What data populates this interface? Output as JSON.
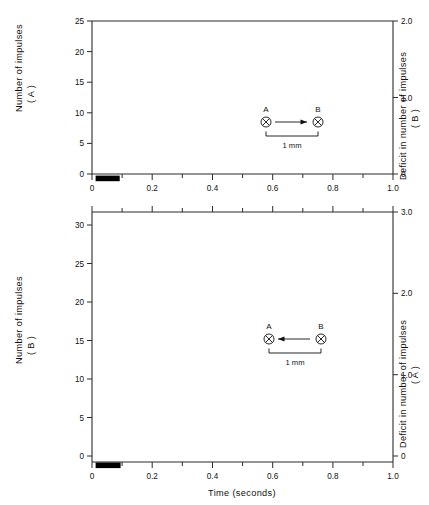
{
  "figure": {
    "background": "#ffffff",
    "ink": "#111111"
  },
  "chart_data": [
    {
      "id": "top-panel",
      "type": "line",
      "title": "",
      "xlabel": "",
      "ylabel": "Number of impulses (A)",
      "y2label": "Deficit in number of impulses (B)",
      "xlim": [
        0,
        1.0
      ],
      "ylim": [
        0,
        25
      ],
      "y2lim": [
        0,
        2.0
      ],
      "xticks": [
        0,
        0.2,
        0.4,
        0.6,
        0.8,
        1.0
      ],
      "xticklabels": [
        "0",
        "0.2",
        "0.4",
        "0.6",
        "0.8",
        "1.0"
      ],
      "xminorticks": [
        0.1,
        0.3,
        0.5,
        0.7,
        0.9
      ],
      "yticks": [
        0,
        5,
        10,
        15,
        20,
        25
      ],
      "yticklabels": [
        "0",
        "5",
        "10",
        "15",
        "20",
        "25"
      ],
      "y2ticks": [
        0,
        1.0,
        2.0
      ],
      "y2ticklabels": [
        "0",
        "1.0",
        "2.0"
      ],
      "grid": false,
      "legend_position": "inline-curve-labels",
      "stimulus_bar": {
        "x_start": 0.012,
        "x_end": 0.092,
        "label": ""
      },
      "inset": {
        "left_label": "A",
        "right_label": "B",
        "arrow_direction": "right",
        "scale_label": "1 mm"
      },
      "series": [
        {
          "name": "A",
          "label": "A",
          "label_x": 0.135,
          "label_y": 11.9,
          "x": [
            0.062,
            0.072,
            0.082,
            0.092,
            0.102,
            0.112,
            0.122,
            0.132,
            0.142,
            0.152,
            0.162,
            0.172,
            0.182,
            0.192,
            0.202,
            0.212,
            0.222,
            0.232,
            0.242,
            0.252,
            0.262,
            0.272
          ],
          "y": [
            0.9,
            1.8,
            2.7,
            3.7,
            4.7,
            5.8,
            6.9,
            8.0,
            9.2,
            10.3,
            11.4,
            12.5,
            13.6,
            14.7,
            15.7,
            16.7,
            17.6,
            18.5,
            19.3,
            20.0,
            20.6,
            21.0
          ]
        },
        {
          "name": "B",
          "label": "B",
          "label_x": 0.4,
          "label_y": 11.6,
          "x": [
            0.012,
            0.032,
            0.052,
            0.072,
            0.092,
            0.112,
            0.132,
            0.152,
            0.172,
            0.192,
            0.212,
            0.232,
            0.252,
            0.272,
            0.292,
            0.312,
            0.332,
            0.352,
            0.372,
            0.392,
            0.412,
            0.432,
            0.452,
            0.472,
            0.492,
            0.512,
            0.532,
            0.552,
            0.572,
            0.592,
            0.612,
            0.642,
            0.672,
            0.702,
            0.732,
            0.762,
            0.792,
            0.822,
            0.852,
            0.882,
            0.912,
            0.942,
            0.972,
            0.995
          ],
          "y": [
            0.9,
            0.55,
            0.4,
            0.3,
            0.25,
            0.2,
            0.2,
            0.2,
            0.2,
            0.25,
            0.3,
            0.5,
            0.8,
            1.4,
            2.3,
            3.4,
            4.8,
            6.4,
            8.2,
            10.2,
            12.1,
            13.9,
            15.5,
            17.0,
            18.2,
            19.1,
            19.8,
            20.3,
            20.7,
            20.9,
            21.05,
            21.2,
            21.2,
            21.3,
            21.25,
            21.2,
            21.15,
            21.1,
            21.05,
            21.0,
            20.95,
            20.9,
            20.85,
            20.8
          ]
        }
      ]
    },
    {
      "id": "bottom-panel",
      "type": "line",
      "title": "",
      "xlabel": "Time (seconds)",
      "ylabel": "Number of impulses (B)",
      "y2label": "Deficit in number of impulses (A)",
      "xlim": [
        0,
        1.0
      ],
      "ylim": [
        0,
        32.5
      ],
      "y2lim": [
        0,
        3.0
      ],
      "xticks": [
        0,
        0.2,
        0.4,
        0.6,
        0.8,
        1.0
      ],
      "xticklabels": [
        "0",
        "0.2",
        "0.4",
        "0.6",
        "0.8",
        "1.0"
      ],
      "xminorticks": [
        0.1,
        0.3,
        0.5,
        0.7,
        0.9
      ],
      "yticks": [
        0,
        5,
        10,
        15,
        20,
        25,
        30
      ],
      "yticklabels": [
        "0",
        "5",
        "10",
        "15",
        "20",
        "25",
        "30"
      ],
      "y2ticks": [
        0,
        1.0,
        2.0,
        3.0
      ],
      "y2ticklabels": [
        "0",
        "1.0",
        "2.0",
        "3.0"
      ],
      "grid": false,
      "legend_position": "inline-curve-labels",
      "stimulus_bar": {
        "x_start": 0.012,
        "x_end": 0.095,
        "label": ""
      },
      "inset": {
        "left_label": "A",
        "right_label": "B",
        "arrow_direction": "left",
        "scale_label": "1 mm"
      },
      "series": [
        {
          "name": "B",
          "label": "B",
          "label_x": 0.175,
          "label_y": 16.5,
          "x": [
            0.062,
            0.082,
            0.102,
            0.122,
            0.142,
            0.162,
            0.182,
            0.202,
            0.222,
            0.242,
            0.262,
            0.282,
            0.302,
            0.322,
            0.342,
            0.372,
            0.402,
            0.432,
            0.462,
            0.492,
            0.522,
            0.552,
            0.582,
            0.607
          ],
          "y": [
            0.8,
            2.3,
            3.9,
            5.5,
            7.1,
            8.7,
            10.3,
            11.9,
            13.6,
            15.3,
            17.1,
            19.0,
            20.9,
            22.6,
            23.9,
            25.1,
            25.7,
            26.2,
            26.8,
            27.3,
            27.8,
            28.3,
            28.8,
            29.0
          ]
        },
        {
          "name": "A",
          "label": "A",
          "label_x": 0.475,
          "label_y": 16.5,
          "x": [
            0.012,
            0.032,
            0.052,
            0.072,
            0.092,
            0.112,
            0.132,
            0.152,
            0.172,
            0.192,
            0.212,
            0.232,
            0.252,
            0.272,
            0.292,
            0.312,
            0.332,
            0.352,
            0.372,
            0.392,
            0.412,
            0.432,
            0.452,
            0.472,
            0.492,
            0.512,
            0.532,
            0.562,
            0.592,
            0.622,
            0.652,
            0.682,
            0.712,
            0.742,
            0.772,
            0.802,
            0.832,
            0.862,
            0.892,
            0.922,
            0.952,
            0.982
          ],
          "y": [
            -0.15,
            -0.1,
            -0.1,
            -0.05,
            0.0,
            0.05,
            0.1,
            0.15,
            0.15,
            0.1,
            0.1,
            0.4,
            1.1,
            2.2,
            3.5,
            5.3,
            7.4,
            9.7,
            12.1,
            14.5,
            16.8,
            18.9,
            20.6,
            22.2,
            23.5,
            24.4,
            25.1,
            25.9,
            26.5,
            26.9,
            27.2,
            27.5,
            27.8,
            28.0,
            28.2,
            28.4,
            28.9,
            29.0,
            28.6,
            28.8,
            28.9,
            29.0
          ]
        }
      ]
    }
  ]
}
